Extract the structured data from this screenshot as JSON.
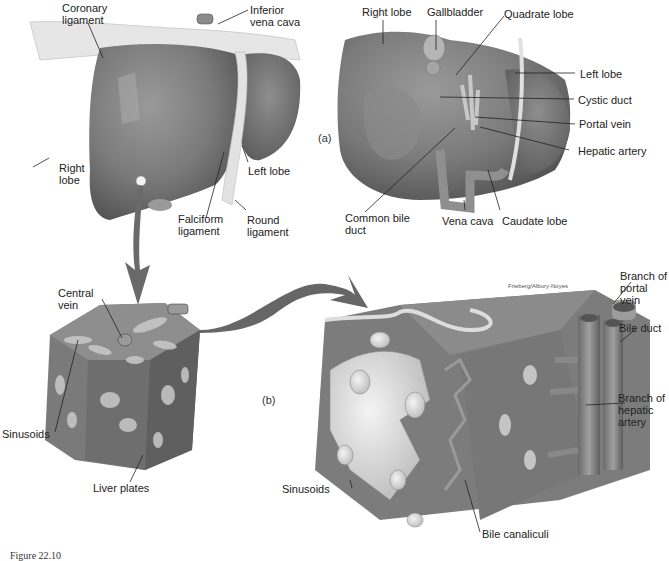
{
  "figure": {
    "panel_a_tag": "(a)",
    "panel_b_tag": "(b)",
    "credit": "Frieberg/Albury-Noyes",
    "caption_partial": "Figure 22.10"
  },
  "panel_a_anterior": {
    "labels": [
      {
        "id": "coronary-ligament",
        "text": "Coronary\nligament"
      },
      {
        "id": "inferior-vena-cava",
        "text": "Inferior\nvena cava"
      },
      {
        "id": "right-lobe",
        "text": "Right\nlobe"
      },
      {
        "id": "left-lobe",
        "text": "Left lobe"
      },
      {
        "id": "falciform-ligament",
        "text": "Falciform\nligament"
      },
      {
        "id": "round-ligament",
        "text": "Round\nligament"
      }
    ]
  },
  "panel_a_inferior": {
    "labels": [
      {
        "id": "right-lobe",
        "text": "Right lobe"
      },
      {
        "id": "gallbladder",
        "text": "Gallbladder"
      },
      {
        "id": "quadrate-lobe",
        "text": "Quadrate lobe"
      },
      {
        "id": "left-lobe",
        "text": "Left lobe"
      },
      {
        "id": "cystic-duct",
        "text": "Cystic duct"
      },
      {
        "id": "portal-vein",
        "text": "Portal vein"
      },
      {
        "id": "hepatic-artery",
        "text": "Hepatic artery"
      },
      {
        "id": "common-bile-duct",
        "text": "Common bile\nduct"
      },
      {
        "id": "vena-cava",
        "text": "Vena cava"
      },
      {
        "id": "caudate-lobe",
        "text": "Caudate lobe"
      }
    ]
  },
  "panel_b_lobule": {
    "labels": [
      {
        "id": "central-vein",
        "text": "Central\nvein"
      },
      {
        "id": "sinusoids",
        "text": "Sinusoids"
      },
      {
        "id": "liver-plates",
        "text": "Liver plates"
      }
    ]
  },
  "panel_b_detail": {
    "labels": [
      {
        "id": "branch-of-portal-vein",
        "text": "Branch of\nportal\nvein"
      },
      {
        "id": "bile-duct",
        "text": "Bile duct"
      },
      {
        "id": "branch-of-hepatic-artery",
        "text": "Branch of\nhepatic\nartery"
      },
      {
        "id": "sinusoids",
        "text": "Sinusoids"
      },
      {
        "id": "bile-canaliculi",
        "text": "Bile canaliculi"
      }
    ]
  }
}
